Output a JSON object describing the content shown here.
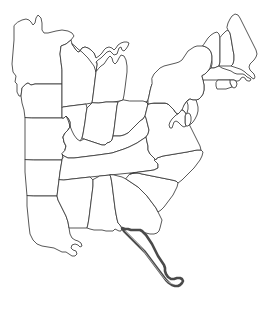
{
  "map": {
    "title": "Eastern United States Outline Map",
    "kind": "political-outline-map",
    "region": "Eastern United States",
    "projection_viewbox": "0 0 272 309",
    "background_color": "#ffffff",
    "outline_color": "#3a3a3a",
    "highlight_outline_color": "#4a4a4a",
    "fill_color": "#ffffff",
    "stroke_width": 0.85,
    "highlight_stroke_width": 2.6,
    "state_count": 27,
    "highlighted_state_count": 1
  },
  "legend": {
    "visible": false,
    "entries": []
  },
  "labels": {
    "visible": false,
    "items": []
  },
  "states": [
    {
      "id": "MN",
      "name": "Minnesota",
      "style": "outline",
      "path": "M14,26 L14,40 L13,52 L12,64 L13,72 L16,76 L15,82 L17,84 L17,92 L19,96 L21,96 L22,88 L26,84 L28,83 L31,85 L35,84 L40,84 L47,84 L55,84 L62,84 L62,70 L61,62 L60,54 L61,46 L66,44 L71,40 L74,36 L72,33 L68,31 L62,30 L56,31 L52,32 L48,33 L44,33 L42,30 L42,23 L41,18 L38,15 L36,18 L35,23 L33,25 L31,22 L29,20 L26,19 L22,20 L18,22 Z"
    },
    {
      "id": "IA",
      "name": "Iowa",
      "style": "outline",
      "path": "M22,88 L21,96 L22,103 L24,110 L25,118 L32,118 L40,118 L48,118 L56,118 L62,118 L62,108 L62,98 L62,84 L55,84 L47,84 L40,84 L35,84 L31,85 L28,83 L26,84 Z"
    },
    {
      "id": "MO",
      "name": "Missouri",
      "style": "outline",
      "path": "M25,118 L25,128 L25,140 L25,152 L25,160 L34,160 L44,160 L54,160 L62,160 L63,154 L65,150 L66,146 L64,142 L63,137 L65,133 L68,130 L70,127 L70,122 L68,118 L66,116 L64,118 L62,118 L56,118 L48,118 L40,118 L32,118 Z"
    },
    {
      "id": "AR",
      "name": "Arkansas",
      "style": "outline",
      "path": "M25,160 L25,172 L26,184 L27,196 L34,196 L42,196 L50,196 L57,196 L58,188 L59,180 L60,172 L61,166 L62,160 L54,160 L44,160 L34,160 Z"
    },
    {
      "id": "LA",
      "name": "Louisiana",
      "style": "outline",
      "path": "M27,196 L27,206 L28,216 L29,226 L30,234 L33,240 L37,244 L42,246 L48,247 L54,248 L58,250 L62,252 L66,252 L69,254 L72,256 L75,256 L77,254 L76,251 L73,250 L71,248 L72,245 L75,244 L78,245 L80,247 L82,246 L81,243 L78,241 L75,240 L72,238 L70,234 L69,228 L68,222 L66,216 L64,212 L62,208 L60,204 L58,200 L57,196 L50,196 L42,196 L34,196 Z"
    },
    {
      "id": "WI",
      "name": "Wisconsin",
      "style": "outline",
      "path": "M62,70 L62,84 L62,98 L62,108 L63,107 L70,106 L78,105 L86,104 L92,103 L93,96 L94,88 L95,80 L96,72 L97,64 L96,58 L94,53 L91,50 L88,48 L85,47 L82,48 L80,51 L78,52 L76,50 L74,47 L72,44 L71,40 L66,44 L61,46 L60,54 L61,62 Z"
    },
    {
      "id": "MI_UP",
      "name": "Michigan Upper Peninsula",
      "style": "outline",
      "path": "M72,44 L74,47 L76,50 L78,52 L80,51 L82,48 L85,47 L88,48 L91,50 L94,53 L96,58 L99,56 L102,53 L104,50 L106,48 L109,47 L112,48 L114,50 L116,48 L118,45 L121,43 L124,42 L127,42 L129,43 L128,46 L126,49 L124,51 L122,50 L121,47 L119,48 L118,51 L117,54 L114,55 L112,53 L110,51 L107,52 L104,55 L101,58 L98,60 L96,62 L97,64 L96,72 L94,66 L91,62 L88,58 L85,55 L82,52 L78,49 L75,46 Z"
    },
    {
      "id": "MI_LP",
      "name": "Michigan Lower Peninsula",
      "style": "outline",
      "path": "M96,72 L95,80 L94,88 L93,96 L92,103 L99,103 L106,102 L113,102 L120,101 L123,100 L124,95 L125,88 L126,80 L127,72 L127,66 L126,60 L124,56 L121,55 L119,58 L117,62 L115,64 L113,62 L112,58 L110,56 L108,58 L106,61 L104,64 L101,66 L99,68 Z"
    },
    {
      "id": "IL",
      "name": "Illinois",
      "style": "outline",
      "path": "M62,108 L62,118 L64,118 L66,116 L68,118 L70,122 L70,127 L68,130 L65,133 L63,137 L64,142 L66,146 L65,150 L68,150 L72,148 L75,146 L78,144 L80,141 L82,138 L83,134 L84,128 L85,122 L86,114 L87,108 L86,104 L78,105 L70,106 L63,107 Z"
    },
    {
      "id": "IN",
      "name": "Indiana",
      "style": "outline",
      "path": "M92,103 L87,108 L86,114 L85,122 L84,128 L83,134 L82,138 L84,139 L87,140 L90,141 L93,142 L96,143 L99,144 L102,145 L105,145 L107,143 L110,142 L112,140 L113,136 L114,130 L115,122 L116,114 L117,106 L118,102 L113,102 L106,102 L99,103 Z"
    },
    {
      "id": "OH",
      "name": "Ohio",
      "style": "outline",
      "path": "M123,100 L120,101 L118,102 L117,106 L116,114 L115,122 L114,130 L113,136 L116,136 L120,136 L124,135 L128,133 L131,130 L134,127 L137,124 L140,121 L143,119 L145,116 L146,112 L147,108 L148,104 L146,102 L143,101 L139,101 L135,101 L130,101 Z"
    },
    {
      "id": "KY",
      "name": "Kentucky",
      "style": "outline",
      "path": "M65,150 L66,146 L64,142 L63,137 L65,133 L68,130 L70,127 L70,122 L68,118 L66,116 L68,120 L70,126 L72,131 L74,135 L77,139 L80,141 L84,139 L87,140 L90,141 L93,142 L96,143 L99,144 L102,145 L105,145 L107,143 L110,142 L112,140 L113,136 L116,136 L120,136 L124,135 L128,133 L131,130 L134,127 L137,124 L140,121 L143,119 L145,116 L146,118 L147,122 L148,126 L149,130 L148,134 L146,137 L143,139 L140,141 L137,143 L133,145 L129,147 L124,149 L118,151 L112,153 L105,154 L98,155 L90,156 L82,157 L74,158 L68,158 L64,156 L62,154 Z"
    },
    {
      "id": "TN",
      "name": "Tennessee",
      "style": "outline",
      "path": "M62,160 L61,166 L60,172 L59,180 L64,180 L72,179 L81,178 L90,177 L100,176 L110,175 L120,174 L130,173 L139,172 L147,171 L154,170 L158,168 L158,164 L156,160 L153,157 L150,154 L148,150 L148,146 L147,142 L146,137 L143,139 L140,141 L137,143 L133,145 L129,147 L124,149 L118,151 L112,153 L105,154 L98,155 L90,156 L82,157 L74,158 L68,158 L64,156 L62,154 L63,157 Z"
    },
    {
      "id": "MS",
      "name": "Mississippi",
      "style": "outline",
      "path": "M59,180 L58,188 L57,196 L58,200 L60,204 L62,208 L64,212 L66,216 L68,222 L69,228 L72,228 L76,228 L80,228 L84,228 L87,228 L88,224 L89,218 L90,210 L91,202 L92,194 L93,186 L93,180 L90,177 L81,178 L72,179 L64,180 Z"
    },
    {
      "id": "AL",
      "name": "Alabama",
      "style": "outline",
      "path": "M93,180 L93,186 L92,194 L91,202 L90,210 L89,218 L88,224 L87,228 L90,229 L94,230 L98,230 L102,230 L106,231 L110,231 L113,231 L115,229 L117,230 L119,231 L121,231 L122,228 L120,225 L118,223 L117,219 L116,214 L115,208 L114,200 L113,192 L112,184 L111,178 L110,175 L100,176 Z"
    },
    {
      "id": "GA",
      "name": "Georgia",
      "style": "outline",
      "path": "M110,175 L111,178 L112,184 L113,192 L114,200 L115,208 L116,214 L117,219 L118,223 L120,225 L122,228 L126,229 L131,230 L136,231 L141,232 L146,233 L150,234 L154,234 L157,233 L159,231 L160,228 L161,224 L162,220 L160,216 L158,212 L156,208 L153,204 L150,200 L147,196 L144,193 L141,190 L138,187 L135,185 L132,183 L129,181 L126,179 L122,177 L118,176 L114,175 Z"
    },
    {
      "id": "SC",
      "name": "South Carolina",
      "style": "outline",
      "path": "M126,179 L129,181 L132,183 L135,185 L138,187 L141,190 L144,193 L147,196 L150,200 L153,204 L156,208 L158,212 L161,210 L164,207 L167,203 L170,199 L173,195 L175,191 L177,187 L178,183 L176,181 L172,180 L167,179 L162,178 L157,177 L152,176 L147,175 L142,174 L138,173 L134,173 L130,174 Z"
    },
    {
      "id": "NC",
      "name": "North Carolina",
      "style": "outline",
      "path": "M130,174 L134,173 L138,173 L142,174 L147,175 L152,176 L157,177 L162,178 L167,179 L172,180 L176,181 L178,183 L182,180 L186,176 L190,172 L194,168 L197,164 L200,160 L202,156 L203,152 L201,150 L197,150 L192,151 L187,152 L181,153 L175,154 L169,155 L163,156 L157,158 L154,160 L158,164 L158,168 L154,170 L147,171 L139,172 Z"
    },
    {
      "id": "VA",
      "name": "Virginia",
      "style": "outline",
      "path": "M148,104 L147,108 L146,112 L145,116 L146,118 L147,122 L148,126 L149,130 L148,134 L146,137 L147,142 L148,146 L148,150 L150,154 L153,157 L156,160 L157,158 L163,156 L169,155 L175,154 L181,153 L187,152 L192,151 L197,150 L201,150 L200,146 L198,142 L196,138 L194,134 L192,130 L190,126 L188,122 L187,118 L186,114 L184,111 L182,110 L180,112 L178,114 L176,113 L174,110 L172,108 L170,106 L168,104 L165,103 L162,103 L158,103 L154,103 Z"
    },
    {
      "id": "WV",
      "name": "West Virginia",
      "style": "outline",
      "path": "M146,102 L148,104 L154,103 L158,103 L162,103 L165,103 L168,104 L170,106 L172,108 L174,110 L176,113 L178,114 L180,112 L182,110 L181,107 L179,104 L177,101 L175,98 L174,95 L173,92 L172,88 L171,84 L170,81 L169,79 L167,80 L166,83 L165,87 L164,91 L163,94 L161,96 L159,97 L156,98 L153,99 L150,100 Z"
    },
    {
      "id": "PA",
      "name": "Pennsylvania",
      "style": "outline",
      "path": "M148,104 L148,100 L149,96 L150,91 L151,87 L152,84 L157,83 L163,82 L170,81 L177,80 L184,79 L191,78 L197,77 L202,76 L203,80 L204,85 L204,90 L203,94 L201,97 L199,99 L196,100 L193,100 L190,99 L188,100 L186,102 L184,105 L182,108 L181,107 L179,104 L177,101 L175,98 L174,95 L173,92 L172,88 L171,84 L170,81 L169,79 L167,80 L166,83 L165,87 L164,91 L163,94 L161,96 L159,97 L156,98 L153,99 L150,100 Z"
    },
    {
      "id": "NY",
      "name": "New York",
      "style": "outline",
      "path": "M152,84 L151,87 L150,91 L149,96 L148,100 L148,104 L154,103 L158,103 L162,103 L165,103 L168,104 L170,106 L172,108 L174,110 L176,113 L178,114 L180,112 L182,110 L184,105 L186,102 L188,100 L190,99 L193,100 L196,100 L199,99 L201,97 L203,94 L204,90 L204,85 L203,80 L202,76 L205,74 L208,71 L210,68 L211,64 L212,60 L212,56 L211,52 L209,49 L206,47 L203,46 L200,46 L197,46 L194,47 L191,49 L188,51 L186,54 L184,57 L182,60 L179,62 L176,63 L172,64 L168,65 L164,66 L160,68 L157,71 L154,74 L152,78 Z"
    },
    {
      "id": "VT",
      "name": "Vermont",
      "style": "outline",
      "path": "M203,46 L206,47 L209,49 L211,52 L212,56 L212,60 L212,64 L211,68 L214,68 L217,67 L219,66 L220,62 L220,56 L220,50 L220,44 L220,38 L219,34 L217,32 L214,33 L211,35 L208,38 L206,41 L204,44 Z"
    },
    {
      "id": "NH",
      "name": "New Hampshire",
      "style": "outline",
      "path": "M220,38 L220,44 L220,50 L220,56 L220,62 L219,66 L222,66 L225,66 L228,66 L231,66 L233,64 L234,60 L234,55 L233,50 L232,44 L231,38 L230,33 L228,30 L226,31 L224,33 L222,35 Z"
    },
    {
      "id": "ME",
      "name": "Maine",
      "style": "outline",
      "path": "M228,30 L230,33 L231,38 L232,44 L233,50 L234,55 L234,60 L233,64 L231,66 L234,67 L237,68 L240,69 L242,70 L245,72 L247,74 L250,76 L252,78 L254,79 L255,77 L254,74 L252,72 L250,70 L249,67 L250,64 L252,62 L254,60 L256,57 L257,54 L256,50 L254,46 L252,42 L250,38 L248,34 L246,30 L244,26 L242,22 L240,18 L238,15 L235,14 L232,16 L230,19 L228,23 L227,27 Z"
    },
    {
      "id": "MA",
      "name": "Massachusetts",
      "style": "outline",
      "path": "M202,76 L203,80 L206,80 L210,80 L214,80 L218,80 L222,80 L226,80 L230,80 L234,80 L236,81 L238,81 L240,80 L241,78 L243,77 L245,78 L246,80 L248,81 L250,81 L251,79 L249,78 L247,77 L245,75 L243,74 L240,74 L237,74 L234,73 L231,71 L228,70 L225,69 L222,68 L219,66 L214,68 L211,68 L208,71 L205,74 Z"
    },
    {
      "id": "RI",
      "name": "Rhode Island",
      "style": "outline",
      "path": "M230,80 L234,80 L236,81 L237,84 L236,87 L234,88 L232,87 L231,85 L230,83 Z"
    },
    {
      "id": "CT",
      "name": "Connecticut",
      "style": "outline",
      "path": "M218,80 L222,80 L226,80 L230,80 L230,83 L231,85 L232,87 L229,88 L226,89 L223,89 L220,89 L217,89 L216,86 L216,83 Z"
    },
    {
      "id": "NJ",
      "name": "New Jersey",
      "style": "outline",
      "path": "M190,99 L193,100 L196,100 L197,103 L198,107 L198,111 L197,115 L195,119 L193,122 L191,124 L189,125 L187,124 L186,121 L186,117 L187,113 L188,109 L188,105 L187,102 Z"
    },
    {
      "id": "DE",
      "name": "Delaware",
      "style": "outline",
      "path": "M186,114 L188,113 L190,114 L191,117 L191,121 L190,124 L188,126 L186,126 L185,123 L185,119 L185,116 Z"
    },
    {
      "id": "MD",
      "name": "Maryland",
      "style": "outline",
      "path": "M182,110 L184,111 L186,114 L185,116 L185,119 L185,123 L186,126 L184,127 L182,126 L180,124 L178,122 L176,121 L174,122 L173,125 L172,128 L170,128 L169,125 L170,122 L172,119 L174,117 L176,115 L178,114 L180,112 Z"
    },
    {
      "id": "FL",
      "name": "Florida",
      "style": "highlighted",
      "path": "M122,228 L124,231 L127,234 L130,237 L133,240 L136,243 L139,246 L142,249 L145,252 L148,256 L151,260 L154,264 L157,268 L160,272 L163,276 L166,280 L169,283 L172,285 L175,286 L178,286 L180,285 L182,283 L183,281 L182,279 L180,278 L177,278 L174,279 L171,279 L168,277 L166,274 L165,271 L165,268 L164,265 L162,262 L160,259 L158,256 L156,252 L154,248 L152,244 L150,241 L148,238 L146,235 L144,233 L142,231 L140,230 L137,230 L134,230 L131,230 L128,229 L125,229 Z",
      "inner_path": "M125,231 L128,234 L131,237 L134,240 L137,243 L140,246 L143,250 L146,254 L149,258 L152,262 L155,266 L158,270 L161,274 L164,278 L167,281 L170,283 L173,284 L176,284 L178,283 L179,281"
    }
  ],
  "water_features": {
    "visible": false,
    "items": []
  }
}
